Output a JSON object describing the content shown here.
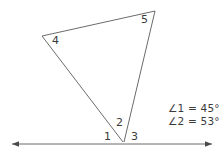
{
  "diagram": {
    "stroke_color": "#6b6b6b",
    "text_color": "#3b3b3b",
    "background_color": "#ffffff",
    "baseline": {
      "name": "horizontal-ray-line",
      "x1": 12,
      "y1": 144,
      "x2": 212,
      "y2": 144,
      "left_arrow": true,
      "right_arrow": true
    },
    "vertices": {
      "apex_top": {
        "x": 155,
        "y": 11
      },
      "apex_left": {
        "x": 42,
        "y": 36
      },
      "vertex_bottom": {
        "x": 123,
        "y": 142
      }
    },
    "segments": [
      {
        "name": "segment-left-to-top",
        "x1": 42,
        "y1": 36,
        "x2": 155,
        "y2": 11
      },
      {
        "name": "segment-left-to-bottom",
        "x1": 42,
        "y1": 36,
        "x2": 123,
        "y2": 142
      },
      {
        "name": "segment-top-to-bottom",
        "x1": 155,
        "y1": 11,
        "x2": 124,
        "y2": 142
      }
    ],
    "angle_labels": [
      {
        "id": "1",
        "text": "1",
        "x": 104,
        "y": 131
      },
      {
        "id": "2",
        "text": "2",
        "x": 116,
        "y": 118
      },
      {
        "id": "3",
        "text": "3",
        "x": 131,
        "y": 131
      },
      {
        "id": "4",
        "text": "4",
        "x": 52,
        "y": 35
      },
      {
        "id": "5",
        "text": "5",
        "x": 141,
        "y": 14
      }
    ],
    "legend": {
      "lines": [
        "∠1 = 45°",
        "∠2 = 53°"
      ]
    }
  }
}
